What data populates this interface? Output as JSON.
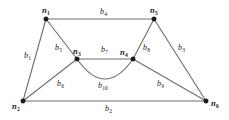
{
  "figure": {
    "type": "undirected-graph-diagram",
    "background_color": "#ffffff",
    "edge_color": "#6e6e6e",
    "node_color": "#1a1a1a"
  },
  "nodes": [
    {
      "id": "n1",
      "base": "n",
      "sub": "1",
      "x": 46,
      "y": 19
    },
    {
      "id": "n2",
      "base": "n",
      "sub": "2",
      "x": 23,
      "y": 101
    },
    {
      "id": "n3",
      "base": "n",
      "sub": "3",
      "x": 77,
      "y": 59
    },
    {
      "id": "n4",
      "base": "n",
      "sub": "4",
      "x": 133,
      "y": 59
    },
    {
      "id": "n5",
      "base": "n",
      "sub": "5",
      "x": 154,
      "y": 19
    },
    {
      "id": "n6",
      "base": "n",
      "sub": "6",
      "x": 206,
      "y": 101
    }
  ],
  "edges": [
    {
      "id": "b1",
      "base": "b",
      "sub": "1",
      "from": "n1",
      "to": "n2",
      "shape": "line",
      "label_x": 24,
      "label_y": 52
    },
    {
      "id": "b2",
      "base": "b",
      "sub": "2",
      "from": "n2",
      "to": "n6",
      "shape": "line",
      "label_x": 105,
      "label_y": 105
    },
    {
      "id": "b3",
      "base": "b",
      "sub": "3",
      "from": "n5",
      "to": "n6",
      "shape": "line",
      "label_x": 178,
      "label_y": 44
    },
    {
      "id": "b4",
      "base": "b",
      "sub": "4",
      "from": "n1",
      "to": "n5",
      "shape": "line",
      "label_x": 100,
      "label_y": 8
    },
    {
      "id": "b5",
      "base": "b",
      "sub": "5",
      "from": "n1",
      "to": "n3",
      "shape": "line",
      "label_x": 55,
      "label_y": 44
    },
    {
      "id": "b6",
      "base": "b",
      "sub": "6",
      "from": "n2",
      "to": "n3",
      "shape": "line",
      "label_x": 57,
      "label_y": 80
    },
    {
      "id": "b7",
      "base": "b",
      "sub": "7",
      "from": "n3",
      "to": "n4",
      "shape": "line",
      "label_x": 101,
      "label_y": 46
    },
    {
      "id": "b8",
      "base": "b",
      "sub": "8",
      "from": "n4",
      "to": "n5",
      "shape": "line",
      "label_x": 143,
      "label_y": 44
    },
    {
      "id": "b9",
      "base": "b",
      "sub": "9",
      "from": "n4",
      "to": "n6",
      "shape": "line",
      "label_x": 157,
      "label_y": 80
    },
    {
      "id": "b10",
      "base": "b",
      "sub": "10",
      "from": "n3",
      "to": "n4",
      "shape": "arc",
      "label_x": 98,
      "label_y": 82
    }
  ]
}
